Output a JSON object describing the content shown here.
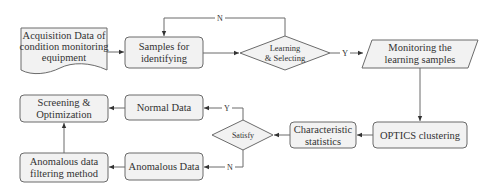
{
  "diagram": {
    "type": "flowchart",
    "nodes": {
      "acquisition": {
        "shape": "document",
        "lines": [
          "Acquisition Data of",
          "condition monitoring",
          "equipment"
        ]
      },
      "samples": {
        "shape": "rounded-rect",
        "lines": [
          "Samples for",
          "identifying"
        ]
      },
      "learning": {
        "shape": "diamond",
        "lines": [
          "Learning",
          "& Selecting"
        ]
      },
      "monitoring": {
        "shape": "parallelogram",
        "lines": [
          "Monitoring  the",
          "learning samples"
        ]
      },
      "optics": {
        "shape": "rounded-rect",
        "lines": [
          "OPTICS clustering"
        ]
      },
      "characteristic": {
        "shape": "rounded-rect",
        "lines": [
          "Characteristic",
          "statistics"
        ]
      },
      "satisfy": {
        "shape": "diamond",
        "lines": [
          "Satisfy"
        ]
      },
      "normal": {
        "shape": "rounded-rect",
        "lines": [
          "Normal Data"
        ]
      },
      "anomalous": {
        "shape": "rounded-rect",
        "lines": [
          "Anomalous Data"
        ]
      },
      "screening": {
        "shape": "rounded-rect",
        "lines": [
          "Screening &",
          "Optimization"
        ]
      },
      "filtering": {
        "shape": "rounded-rect",
        "lines": [
          "Anomalous data",
          "filtering method"
        ]
      }
    },
    "edge_labels": {
      "learning_no": "N",
      "learning_yes": "Y",
      "satisfy_yes": "Y",
      "satisfy_no": "N"
    },
    "edges": [
      {
        "from": "acquisition",
        "to": "samples"
      },
      {
        "from": "samples",
        "to": "learning"
      },
      {
        "from": "learning",
        "to": "samples",
        "label": "N"
      },
      {
        "from": "learning",
        "to": "monitoring",
        "label": "Y"
      },
      {
        "from": "monitoring",
        "to": "optics"
      },
      {
        "from": "optics",
        "to": "characteristic"
      },
      {
        "from": "characteristic",
        "to": "satisfy"
      },
      {
        "from": "satisfy",
        "to": "normal",
        "label": "Y"
      },
      {
        "from": "satisfy",
        "to": "anomalous",
        "label": "N"
      },
      {
        "from": "normal",
        "to": "screening"
      },
      {
        "from": "anomalous",
        "to": "filtering"
      },
      {
        "from": "filtering",
        "to": "screening"
      }
    ],
    "colors": {
      "fill": "#f2f2f2",
      "stroke": "#6b6b6b",
      "text": "#333333"
    }
  }
}
